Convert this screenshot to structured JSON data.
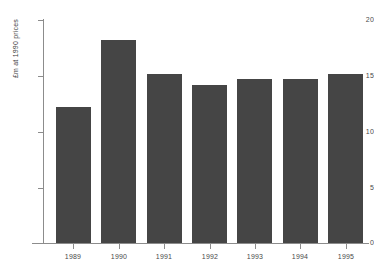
{
  "chart_data": {
    "type": "bar",
    "title": "",
    "subtitle": "",
    "xlabel": "",
    "ylabel": "£m at 1990 prices",
    "categories": [
      "1989",
      "1990",
      "1991",
      "1992",
      "1993",
      "1994",
      "1995"
    ],
    "values": [
      12.2,
      18.2,
      15.2,
      14.2,
      14.7,
      14.7,
      15.2
    ],
    "series": [
      {
        "name": "",
        "values": [
          12.2,
          18.2,
          15.2,
          14.2,
          14.7,
          14.7,
          15.2
        ]
      }
    ],
    "ylim": [
      0,
      20
    ],
    "xlim": [
      0,
      7
    ],
    "yticks": [
      0,
      5,
      10,
      15,
      20
    ],
    "ytick_labels": [
      "0",
      "5",
      "10",
      "15",
      "20"
    ],
    "xtick_labels": [
      "1989",
      "1990",
      "1991",
      "1992",
      "1993",
      "1994",
      "1995"
    ],
    "grid": false,
    "legend": false,
    "legend_position": "none",
    "bar_color": "#454545",
    "axis_color": "#8c8c8c",
    "text_color": "#4a4a4a",
    "background_color": "#ffffff",
    "annotations": []
  },
  "axes": {
    "y_title": "£m at 1990 prices",
    "y_labels": [
      "20",
      "15",
      "10",
      "5",
      "0"
    ],
    "x_labels": [
      "1989",
      "1990",
      "1991",
      "1992",
      "1993",
      "1994",
      "1995"
    ]
  }
}
